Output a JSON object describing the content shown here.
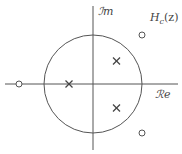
{
  "diagram": {
    "title_main": "H",
    "title_sub": "c",
    "title_arg": "(z)",
    "axes": {
      "imag_label": "ℐm",
      "real_label": "ℛe"
    },
    "unit_circle": true,
    "poles": [
      {
        "re": -0.5,
        "im": 0
      },
      {
        "re": 0.47,
        "im": 0.48
      },
      {
        "re": 0.47,
        "im": -0.48
      }
    ],
    "zeros": [
      {
        "re": -1.5,
        "im": 0
      },
      {
        "re": 1.0,
        "im": 1.0
      },
      {
        "re": 1.0,
        "im": -1.0
      }
    ],
    "colors": {
      "line": "#555555",
      "text": "#444444",
      "background": "#ffffff"
    }
  }
}
